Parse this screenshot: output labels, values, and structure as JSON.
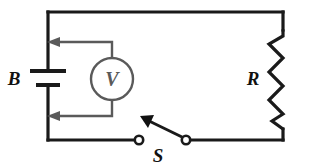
{
  "figure": {
    "kind": "circuit-schematic",
    "title": "",
    "background_color": "#ffffff",
    "wire_color": "#1a1a1a",
    "meter_color": "#5a5a5a",
    "label_color": "#111111"
  },
  "labels": {
    "battery": "B",
    "voltmeter": "V",
    "switch": "S",
    "resistor": "R"
  },
  "components": {
    "battery": {
      "name": "battery",
      "label": "B",
      "position": "left-branch"
    },
    "voltmeter": {
      "name": "voltmeter",
      "label": "V",
      "position": "parallel-across-battery"
    },
    "switch": {
      "name": "switch",
      "label": "S",
      "state": "open",
      "position": "bottom-branch"
    },
    "resistor": {
      "name": "resistor",
      "label": "R",
      "position": "right-branch"
    }
  }
}
